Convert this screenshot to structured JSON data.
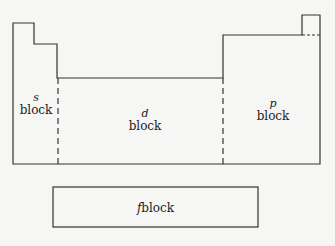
{
  "diagram": {
    "blocks": [
      {
        "id": "s",
        "letter": "s",
        "label": "block"
      },
      {
        "id": "d",
        "letter": "d",
        "label": "block"
      },
      {
        "id": "p",
        "letter": "p",
        "label": "block"
      },
      {
        "id": "f",
        "letter": "f",
        "label": "block"
      }
    ],
    "colors": {
      "line": "#333333",
      "background": "#f6f6f4"
    }
  }
}
